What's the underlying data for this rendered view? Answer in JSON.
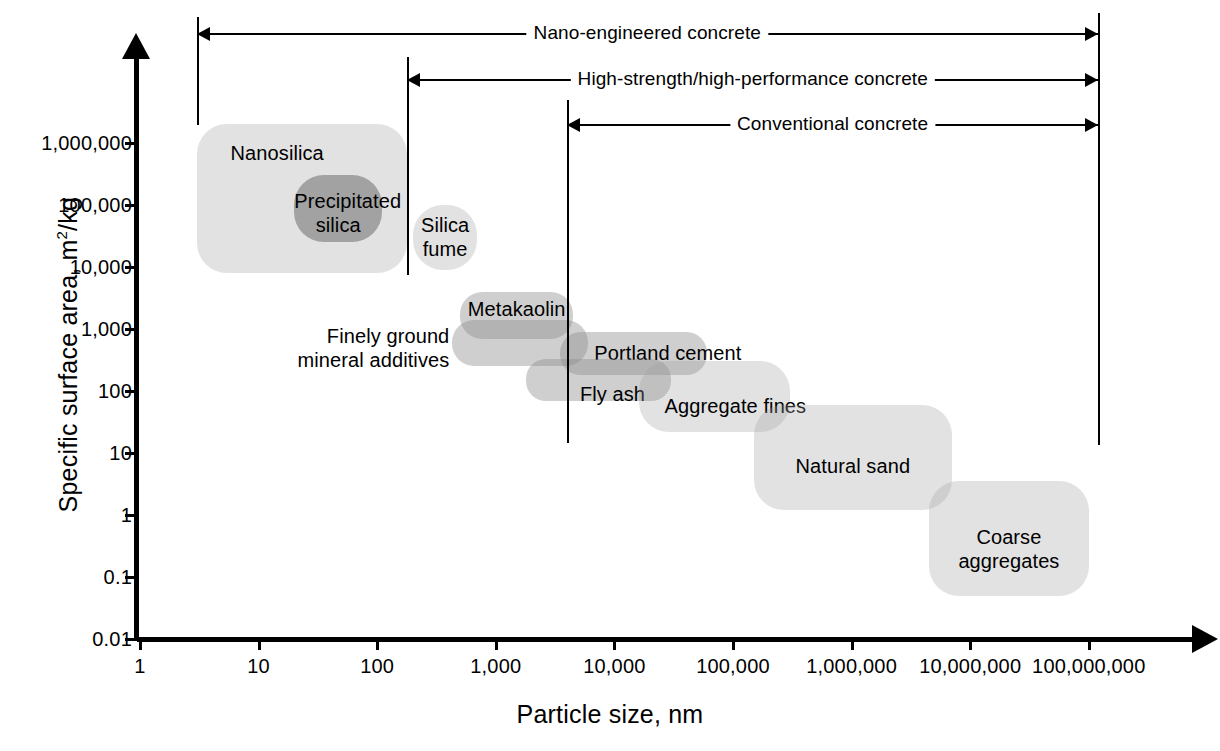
{
  "chart_data": {
    "type": "scatter",
    "title": "",
    "xlabel": "Particle size, nm",
    "ylabel": "Specific surface area, m2/kg",
    "ylabel_base": "Specific surface area, m",
    "ylabel_sup": "2",
    "ylabel_tail": "/kg",
    "xlim": [
      1,
      100000000
    ],
    "ylim": [
      0.01,
      10000000
    ],
    "xscale": "log",
    "yscale": "log",
    "grid": false,
    "legend": "none",
    "xticks": [
      "1",
      "10",
      "100",
      "1,000",
      "10,000",
      "100,000",
      "1,000,000",
      "10,000,000",
      "100,000,000"
    ],
    "yticks": [
      "1,000,000",
      "100,000",
      "10,000",
      "1,000",
      "100",
      "10",
      "1",
      "0.1",
      "0.01"
    ],
    "regions": [
      {
        "name": "Nanosilica",
        "label": "Nanosilica",
        "x_range": [
          3,
          180
        ],
        "y_range": [
          8000,
          2000000
        ],
        "shade": "light"
      },
      {
        "name": "Precipitated silica",
        "label": "Precipitated silica",
        "x_range": [
          20,
          110
        ],
        "y_range": [
          25000,
          300000
        ],
        "shade": "dark"
      },
      {
        "name": "Silica fume",
        "label": "Silica fume",
        "x_range": [
          200,
          700
        ],
        "y_range": [
          9000,
          100000
        ],
        "shade": "light"
      },
      {
        "name": "Metakaolin",
        "label": "Metakaolin",
        "x_range": [
          500,
          4500
        ],
        "y_range": [
          700,
          4000
        ],
        "shade": "mid"
      },
      {
        "name": "Finely ground mineral additives",
        "label": "Finely ground mineral additives",
        "x_range": [
          430,
          6000
        ],
        "y_range": [
          250,
          1400
        ],
        "shade": "mid"
      },
      {
        "name": "Portland cement",
        "label": "Portland cement",
        "x_range": [
          3500,
          60000
        ],
        "y_range": [
          180,
          900
        ],
        "shade": "mid"
      },
      {
        "name": "Fly ash",
        "label": "Fly ash",
        "x_range": [
          1800,
          30000
        ],
        "y_range": [
          70,
          330
        ],
        "shade": "mid"
      },
      {
        "name": "Aggregate fines",
        "label": "Aggregate fines",
        "x_range": [
          16000,
          300000
        ],
        "y_range": [
          22,
          300
        ],
        "shade": "light"
      },
      {
        "name": "Natural sand",
        "label": "Natural sand",
        "x_range": [
          150000,
          7000000
        ],
        "y_range": [
          1.2,
          60
        ],
        "shade": "light"
      },
      {
        "name": "Coarse aggregates",
        "label": "Coarse aggregates",
        "x_range": [
          4500000,
          100000000
        ],
        "y_range": [
          0.05,
          3.5
        ],
        "shade": "light"
      }
    ]
  },
  "annotations": {
    "brackets": [
      {
        "label": "Nano-engineered concrete",
        "x_from": 3,
        "x_to": 45000000
      },
      {
        "label": "High-strength/high-performance concrete",
        "x_from": 180,
        "x_to": 45000000
      },
      {
        "label": "Conventional concrete",
        "x_from": 4000,
        "x_to": 45000000
      }
    ]
  },
  "colors": {
    "axis": "#000000",
    "blob_light": "#d9d9d9",
    "blob_mid": "#c4c4c4",
    "blob_dark": "#a6a6a6",
    "background": "#ffffff",
    "text": "#000000"
  }
}
